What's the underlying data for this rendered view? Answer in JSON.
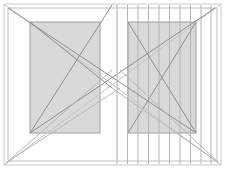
{
  "canvas": {
    "width": 226,
    "height": 169,
    "background": "#ffffff",
    "title": "Wireframe elevation drawing"
  },
  "palette": {
    "outline_light": "#c9c9c9",
    "outline_mid": "#a8a8a8",
    "diagonal_dark": "#8f8f8f",
    "diagonal_light": "#c4c4c4",
    "panel_fill": "#d9d9d9",
    "panel_stroke": "#a0a0a0",
    "hatch_line": "#b5b5b5",
    "background": "#ffffff"
  },
  "chart_data": {
    "type": "line",
    "xlabel": "",
    "ylabel": "",
    "xlim": [
      0,
      226
    ],
    "ylim": [
      0,
      169
    ],
    "grid": false,
    "legend_position": "none",
    "series": [
      {
        "name": "outer-frame",
        "kind": "polygon",
        "stroke": "#c9c9c9",
        "width": 1,
        "points": [
          [
            4,
            4
          ],
          [
            221,
            4
          ],
          [
            221,
            165
          ],
          [
            4,
            165
          ]
        ]
      },
      {
        "name": "inner-frame",
        "kind": "polygon",
        "stroke": "#bdbdbd",
        "width": 1,
        "points": [
          [
            8,
            8
          ],
          [
            217,
            8
          ],
          [
            217,
            161
          ],
          [
            8,
            161
          ]
        ]
      },
      {
        "name": "diagonal-tl-br-outer",
        "kind": "line",
        "stroke": "#c4c4c4",
        "width": 1,
        "points": [
          [
            4,
            4
          ],
          [
            221,
            165
          ]
        ]
      },
      {
        "name": "diagonal-bl-tr-outer",
        "kind": "line",
        "stroke": "#c4c4c4",
        "width": 1,
        "points": [
          [
            4,
            165
          ],
          [
            221,
            4
          ]
        ]
      },
      {
        "name": "diagonal-left-panel-tl-br",
        "kind": "line",
        "stroke": "#8f8f8f",
        "width": 1,
        "points": [
          [
            30,
            22
          ],
          [
            112,
            88
          ]
        ]
      },
      {
        "name": "diagonal-left-panel-bl-tr",
        "kind": "line",
        "stroke": "#8f8f8f",
        "width": 1,
        "points": [
          [
            30,
            133
          ],
          [
            112,
            5
          ]
        ]
      },
      {
        "name": "diagonal-span-long-down",
        "kind": "line",
        "stroke": "#8f8f8f",
        "width": 1,
        "points": [
          [
            8,
            8
          ],
          [
            196,
            133
          ]
        ]
      },
      {
        "name": "diagonal-span-long-up",
        "kind": "line",
        "stroke": "#8f8f8f",
        "width": 1,
        "points": [
          [
            30,
            133
          ],
          [
            215,
            8
          ]
        ]
      },
      {
        "name": "diagonal-right-panel-tl-br",
        "kind": "line",
        "stroke": "#8f8f8f",
        "width": 1,
        "points": [
          [
            128,
            22
          ],
          [
            196,
            133
          ]
        ]
      },
      {
        "name": "diagonal-right-panel-bl-tr",
        "kind": "line",
        "stroke": "#8f8f8f",
        "width": 1,
        "points": [
          [
            128,
            133
          ],
          [
            196,
            22
          ]
        ]
      },
      {
        "name": "diagonal-lower-left-fan-a",
        "kind": "line",
        "stroke": "#b8b8b8",
        "width": 1,
        "points": [
          [
            6,
            163
          ],
          [
            120,
            88
          ]
        ]
      },
      {
        "name": "diagonal-lower-left-fan-b",
        "kind": "line",
        "stroke": "#b8b8b8",
        "width": 1,
        "points": [
          [
            6,
            163
          ],
          [
            112,
            70
          ]
        ]
      },
      {
        "name": "diagonal-lower-right-fan-a",
        "kind": "line",
        "stroke": "#b8b8b8",
        "width": 1,
        "points": [
          [
            219,
            163
          ],
          [
            112,
            88
          ]
        ]
      },
      {
        "name": "diagonal-lower-right-fan-b",
        "kind": "line",
        "stroke": "#b8b8b8",
        "width": 1,
        "points": [
          [
            219,
            163
          ],
          [
            120,
            70
          ]
        ]
      },
      {
        "name": "center-vertical-axis",
        "kind": "line",
        "stroke": "#cccccc",
        "width": 1,
        "points": [
          [
            117,
            5
          ],
          [
            117,
            164
          ]
        ]
      }
    ],
    "panels": [
      {
        "name": "left-panel",
        "x": 30,
        "y": 22,
        "width": 70,
        "height": 111,
        "fill": "#d9d9d9",
        "stroke": "#a0a0a0"
      },
      {
        "name": "right-panel",
        "x": 128,
        "y": 22,
        "width": 68,
        "height": 111,
        "fill": "#d9d9d9",
        "stroke": "#a0a0a0"
      }
    ],
    "hatch": {
      "name": "vertical-hatch-band",
      "orientation": "vertical",
      "stroke": "#b5b5b5",
      "width": 1,
      "y_top": 5,
      "y_bottom": 164,
      "x_positions": [
        117,
        127.5,
        138,
        148.5,
        159,
        169.5,
        180,
        190.5,
        201,
        211
      ]
    }
  }
}
